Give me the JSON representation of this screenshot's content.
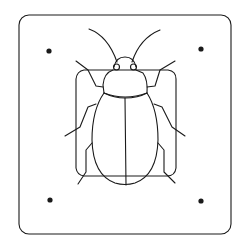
{
  "illustration": {
    "subject": "beetle specimen mounted on card",
    "stroke_color": "#1a1a1a",
    "background_color": "#ffffff",
    "card": {
      "x": 18,
      "y": 15,
      "width": 213,
      "height": 219,
      "radius": 10
    },
    "pins": [
      {
        "name": "pin-top-left",
        "cx": 49,
        "cy": 51
      },
      {
        "name": "pin-top-right",
        "cx": 201,
        "cy": 49
      },
      {
        "name": "pin-bottom-left",
        "cx": 50,
        "cy": 200
      },
      {
        "name": "pin-bottom-right",
        "cx": 201,
        "cy": 201
      }
    ],
    "mount_plate": {
      "x": 76,
      "y": 70,
      "width": 100,
      "height": 107,
      "radius": 8
    }
  }
}
